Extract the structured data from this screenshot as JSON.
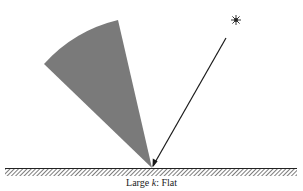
{
  "figure": {
    "caption_prefix": "Large ",
    "caption_var": "k",
    "caption_suffix": ": Flat",
    "caption_full": "Large k: Flat"
  },
  "elements": {
    "light_source": "star-icon",
    "incident_ray": "arrow",
    "reflection_lobe": "shaded-cone",
    "surface": "hatched-ground"
  },
  "colors": {
    "lobe_fill": "#7a7a7a",
    "ray": "#1a1a1a",
    "surface_line": "#222222",
    "hatch": "#444444",
    "background": "#ffffff"
  }
}
